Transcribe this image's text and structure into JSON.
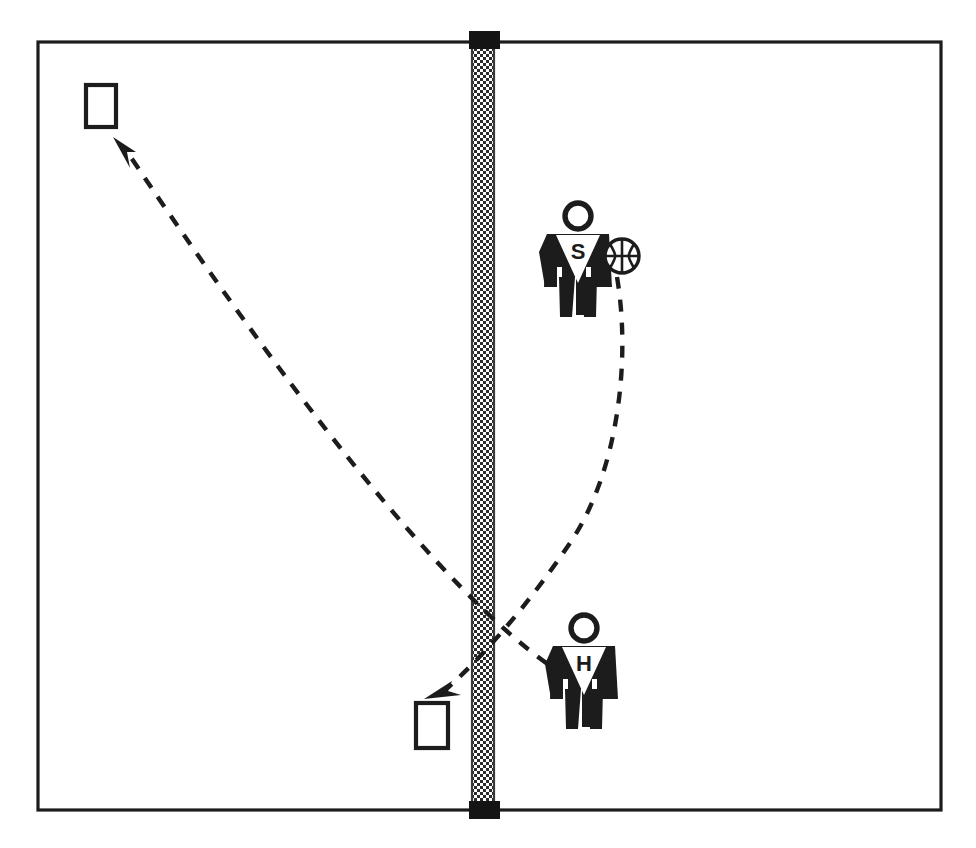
{
  "diagram": {
    "type": "sports-play-diagram",
    "colors": {
      "ink": "#1c1c1c",
      "background": "#ffffff",
      "net_mesh": "#3a3a3a",
      "post": "#141414"
    },
    "court": {
      "name": "court-boundary",
      "x": 38,
      "y": 42,
      "width": 903,
      "height": 768
    },
    "net": {
      "name": "net",
      "x": 472,
      "y": 42,
      "width": 22,
      "height": 768,
      "pattern": "checkered-mesh",
      "top_post_label": "",
      "bottom_post_label": ""
    },
    "players": [
      {
        "id": "player-s",
        "letter": "S",
        "role_label": "S",
        "x": 578,
        "y": 205,
        "has_ball": true
      },
      {
        "id": "player-h",
        "letter": "H",
        "role_label": "H",
        "x": 584,
        "y": 617,
        "has_ball": false
      }
    ],
    "ball": {
      "name": "basketball",
      "cx": 622,
      "cy": 256,
      "r": 17
    },
    "targets": [
      {
        "id": "target-top-left",
        "label": "",
        "x": 86,
        "y": 85,
        "width": 30,
        "height": 42
      },
      {
        "id": "target-bottom-mid",
        "label": "",
        "x": 416,
        "y": 703,
        "width": 32,
        "height": 45
      }
    ],
    "paths": [
      {
        "id": "ball-path-serve",
        "label": "",
        "style": "dashed",
        "from": "basketball",
        "to": "target-bottom-mid",
        "d": "M 617 277 C 631 360 618 470 572 540 C 530 603 480 660 443 692",
        "arrow_at": "end"
      },
      {
        "id": "pass-path-return",
        "label": "",
        "style": "dashed",
        "from": "player-h-area",
        "to": "target-top-left",
        "d": "M 566 676 C 470 618 320 440 124 147",
        "arrow_at": "end"
      }
    ]
  }
}
